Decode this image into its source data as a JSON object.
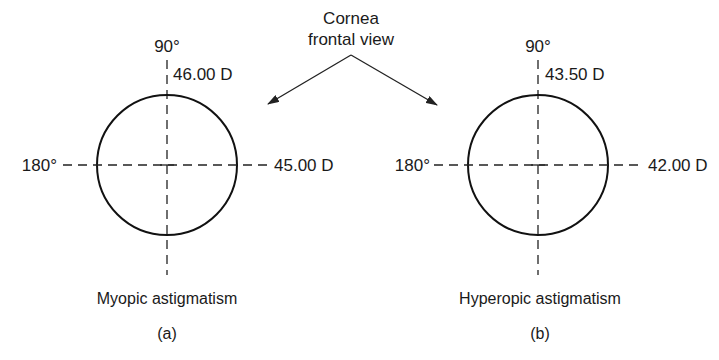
{
  "title": {
    "line1": "Cornea",
    "line2": "frontal view"
  },
  "panels": [
    {
      "id": "a",
      "vertical_label": "90°",
      "vertical_power": "46.00 D",
      "horizontal_label": "180°",
      "horizontal_power": "45.00 D",
      "caption": "Myopic astigmatism",
      "letter": "(a)"
    },
    {
      "id": "b",
      "vertical_label": "90°",
      "vertical_power": "43.50 D",
      "horizontal_label": "180°",
      "horizontal_power": "42.00 D",
      "caption": "Hyperopic astigmatism",
      "letter": "(b)"
    }
  ],
  "colors": {
    "line": "#111111",
    "background": "#ffffff"
  }
}
